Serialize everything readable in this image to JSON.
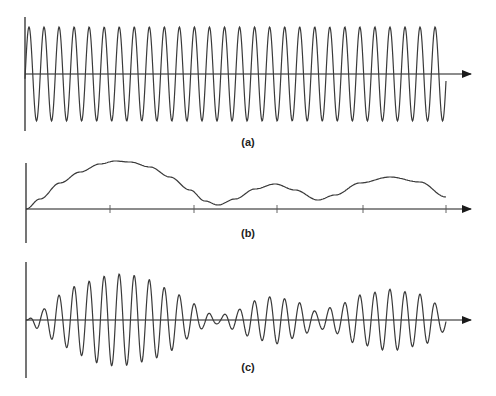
{
  "figure": {
    "panels": [
      {
        "id": "a",
        "label": "(a)",
        "description": "Constant-amplitude carrier sine wave"
      },
      {
        "id": "b",
        "label": "(b)",
        "description": "Modulating envelope signal"
      },
      {
        "id": "c",
        "label": "(c)",
        "description": "Amplitude-modulated carrier following envelope (b)"
      }
    ],
    "colors": {
      "axis": "#1a1a1a",
      "wave": "#3a3a3a",
      "background": "#ffffff"
    }
  },
  "chart_data": [
    {
      "type": "line",
      "title": "(a)",
      "xlabel": "",
      "ylabel": "",
      "grid": false,
      "layout": {
        "x0": 25,
        "x_end": 446,
        "axis_y": 74,
        "y_top": 17,
        "y_bottom": 131,
        "arrow_x": 471
      },
      "carrier": {
        "period_px": 15.04,
        "amplitude_px": 47,
        "first_peak_x": 29,
        "cycles": 28
      }
    },
    {
      "type": "line",
      "title": "(b)",
      "xlabel": "",
      "ylabel": "",
      "grid": false,
      "layout": {
        "x0": 26,
        "x_end": 446,
        "axis_y": 209,
        "y_top": 163,
        "y_bottom": 243,
        "arrow_x": 471
      },
      "ticks_x": [
        110,
        194,
        277,
        363,
        446
      ],
      "envelope": [
        [
          26,
          0
        ],
        [
          40,
          10
        ],
        [
          60,
          26
        ],
        [
          80,
          37
        ],
        [
          100,
          45
        ],
        [
          115,
          48
        ],
        [
          130,
          47
        ],
        [
          150,
          42
        ],
        [
          170,
          32
        ],
        [
          190,
          19
        ],
        [
          205,
          8
        ],
        [
          218,
          4
        ],
        [
          235,
          10
        ],
        [
          255,
          20
        ],
        [
          275,
          25
        ],
        [
          295,
          19
        ],
        [
          318,
          9
        ],
        [
          335,
          14
        ],
        [
          360,
          26
        ],
        [
          390,
          32
        ],
        [
          420,
          27
        ],
        [
          446,
          12
        ]
      ]
    },
    {
      "type": "line",
      "title": "(c)",
      "xlabel": "",
      "ylabel": "",
      "grid": false,
      "layout": {
        "x0": 26,
        "x_end": 446,
        "axis_y": 320,
        "y_top": 262,
        "y_bottom": 378,
        "arrow_x": 471
      },
      "carrier": {
        "period_px": 15.04,
        "first_peak_x": 44
      },
      "envelope_scale": 0.96
    }
  ]
}
